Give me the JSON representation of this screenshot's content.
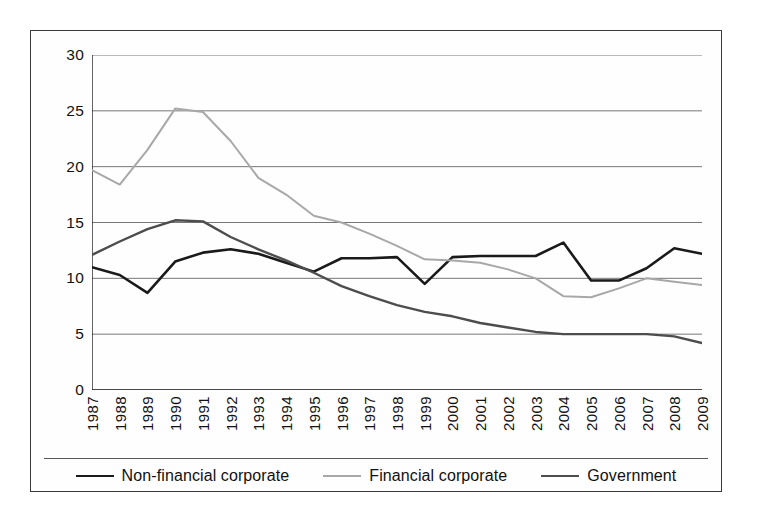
{
  "chart_data": {
    "type": "line",
    "title": "",
    "subtitle": "",
    "xlabel": "",
    "ylabel": "",
    "xlim": [
      1987,
      2009
    ],
    "ylim": [
      0,
      30
    ],
    "grid": true,
    "grid_axis": "y",
    "legend_position": "bottom",
    "x": [
      1987,
      1988,
      1989,
      1990,
      1991,
      1992,
      1993,
      1994,
      1995,
      1996,
      1997,
      1998,
      1999,
      2000,
      2001,
      2002,
      2003,
      2004,
      2005,
      2006,
      2007,
      2008,
      2009
    ],
    "categories": [
      "1987",
      "1988",
      "1989",
      "1990",
      "1991",
      "1992",
      "1993",
      "1994",
      "1995",
      "1996",
      "1997",
      "1998",
      "1999",
      "2000",
      "2001",
      "2002",
      "2003",
      "2004",
      "2005",
      "2006",
      "2007",
      "2008",
      "2009"
    ],
    "ytick_labels": [
      "0",
      "5",
      "10",
      "15",
      "20",
      "25",
      "30"
    ],
    "ytick_values": [
      0,
      5,
      10,
      15,
      20,
      25,
      30
    ],
    "series": [
      {
        "name": "Non-financial corporate",
        "color": "#1a1a1a",
        "width": 2.6,
        "values": [
          11.0,
          10.3,
          8.7,
          11.5,
          12.3,
          12.6,
          12.2,
          11.4,
          10.6,
          11.8,
          11.8,
          11.9,
          9.5,
          11.9,
          12.0,
          12.0,
          12.0,
          13.2,
          9.8,
          9.8,
          10.9,
          12.7,
          12.2
        ]
      },
      {
        "name": "Financial corporate",
        "color": "#a8a8a8",
        "width": 2.0,
        "values": [
          19.7,
          18.4,
          21.5,
          25.2,
          24.9,
          22.3,
          19.0,
          17.5,
          15.6,
          15.0,
          14.0,
          12.9,
          11.7,
          11.6,
          11.4,
          10.8,
          10.0,
          8.4,
          8.3,
          9.1,
          10.0,
          9.7,
          9.4
        ]
      },
      {
        "name": "Government",
        "color": "#4d4d4d",
        "width": 2.4,
        "values": [
          12.1,
          13.3,
          14.4,
          15.2,
          15.1,
          13.7,
          12.6,
          11.6,
          10.5,
          9.3,
          8.4,
          7.6,
          7.0,
          6.6,
          6.0,
          5.6,
          5.2,
          5.0,
          5.0,
          5.0,
          5.0,
          4.8,
          4.2
        ]
      }
    ]
  },
  "legend": {
    "items": [
      {
        "label": "Non-financial corporate",
        "color": "#1a1a1a"
      },
      {
        "label": "Financial corporate",
        "color": "#a8a8a8"
      },
      {
        "label": "Government",
        "color": "#4d4d4d"
      }
    ]
  },
  "colors": {
    "frame": "#3a3a3a",
    "gridline": "#777777",
    "axis": "#222222",
    "background": "#ffffff"
  }
}
